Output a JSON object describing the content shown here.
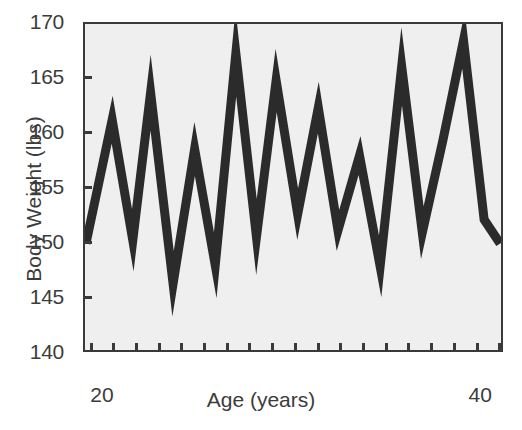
{
  "chart_data": {
    "type": "line",
    "title": "",
    "xlabel": "Age (years)",
    "ylabel": "Body Weight (lbs)",
    "xlim": [
      19,
      41.2
    ],
    "ylim": [
      140,
      170
    ],
    "yticks": [
      140,
      145,
      150,
      155,
      160,
      165,
      170
    ],
    "ytick_labels": [
      "140",
      "145",
      "150",
      "155",
      "160",
      "165",
      "170"
    ],
    "xticks": [
      20,
      40
    ],
    "xtick_labels": [
      "20",
      "40"
    ],
    "x_minor_ticks": [
      19.4,
      20.6,
      21.8,
      23.0,
      24.2,
      25.4,
      26.6,
      27.8,
      29.0,
      30.2,
      31.4,
      32.6,
      33.8,
      35.0,
      36.2,
      37.4,
      38.6,
      39.8,
      41.0
    ],
    "grid": false,
    "legend": null,
    "line_color": "#2b2b2b",
    "line_width_px": 9,
    "plot_background": "#efefef",
    "frame_color": "#3a3a3a",
    "series": [
      {
        "name": "Body Weight",
        "x": [
          19.05,
          20.45,
          21.55,
          22.5,
          23.7,
          24.85,
          25.95,
          27.05,
          28.15,
          29.2,
          30.35,
          31.45,
          32.5,
          33.65,
          34.75,
          35.9,
          37.0,
          38.1,
          39.2,
          40.3,
          41.15
        ],
        "y": [
          149.8,
          161.2,
          150.1,
          163.7,
          146.1,
          158.5,
          147.8,
          167.3,
          150.4,
          164.8,
          152.5,
          162.3,
          151.0,
          157.9,
          147.7,
          166.1,
          150.8,
          159.3,
          168.5,
          152.0,
          149.8
        ]
      }
    ]
  },
  "axes": {
    "y_title": "Body Weight (lbs)",
    "x_title": "Age (years)"
  }
}
